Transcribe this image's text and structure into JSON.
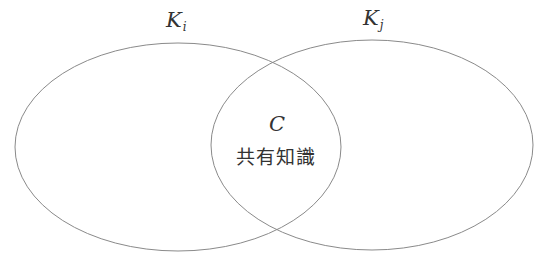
{
  "diagram": {
    "type": "venn",
    "stroke_color": "#8a8a8a",
    "sets": [
      {
        "id": "left",
        "label_main": "K",
        "label_sub": "i",
        "cx": 178,
        "cy": 147,
        "rx": 163,
        "ry": 104
      },
      {
        "id": "right",
        "label_main": "K",
        "label_sub": "j",
        "cx": 372,
        "cy": 145,
        "rx": 161,
        "ry": 105
      }
    ],
    "intersection": {
      "symbol": "C",
      "text": "共有知識"
    }
  }
}
